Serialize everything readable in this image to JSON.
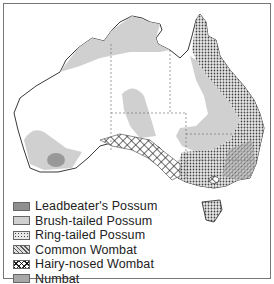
{
  "map": {
    "subject": "Australia",
    "legend": [
      {
        "label": "Leadbeater's Possum",
        "pattern": "dark-grey",
        "color": "#8f8f8f"
      },
      {
        "label": "Brush-tailed Possum",
        "pattern": "light-grey",
        "color": "#d0d0d0"
      },
      {
        "label": "Ring-tailed Possum",
        "pattern": "dots",
        "color": "#888888"
      },
      {
        "label": "Common Wombat",
        "pattern": "diagonal-hatch",
        "color": "#666666"
      },
      {
        "label": "Hairy-nosed Wombat",
        "pattern": "cross-hatch",
        "color": "#222222"
      },
      {
        "label": "Numbat",
        "pattern": "mid-grey",
        "color": "#a8a8a8"
      }
    ]
  }
}
